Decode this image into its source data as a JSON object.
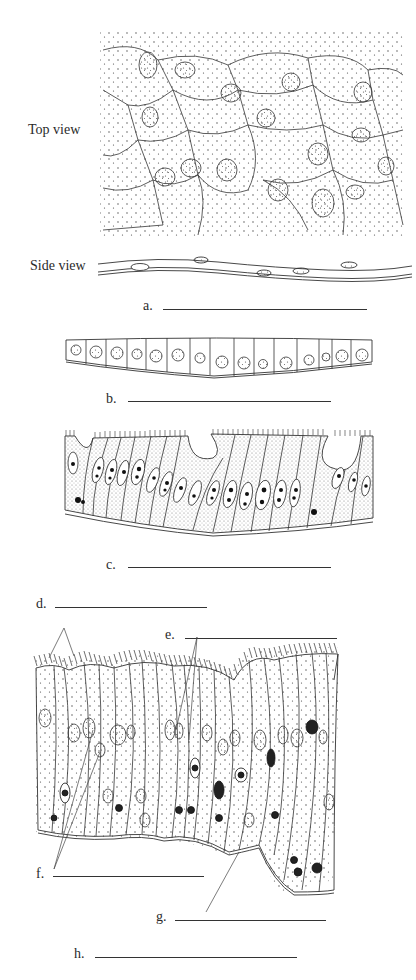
{
  "figure": {
    "top_view": {
      "label": "Top view"
    },
    "side_view": {
      "label": "Side view"
    },
    "panels": [
      {
        "id": "a",
        "label": "a.",
        "answer": ""
      },
      {
        "id": "b",
        "label": "b.",
        "answer": ""
      },
      {
        "id": "c",
        "label": "c.",
        "answer": ""
      }
    ],
    "pseudostratified_labels": [
      {
        "id": "d",
        "label": "d.",
        "answer": ""
      },
      {
        "id": "e",
        "label": "e.",
        "answer": ""
      },
      {
        "id": "f",
        "label": "f.",
        "answer": ""
      },
      {
        "id": "g",
        "label": "g.",
        "answer": ""
      },
      {
        "id": "h",
        "label": "h.",
        "answer": ""
      }
    ]
  },
  "colors": {
    "ink": "#222222",
    "stipple": "#555555",
    "background": "#ffffff"
  }
}
